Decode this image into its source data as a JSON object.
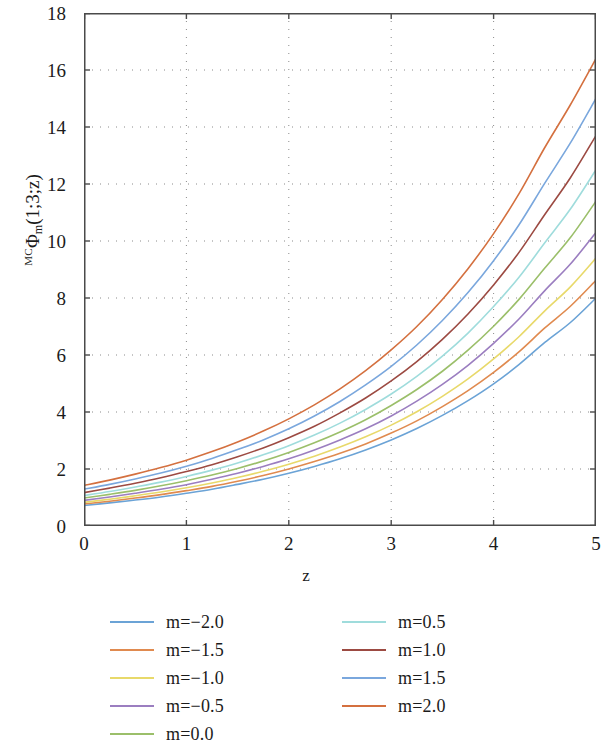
{
  "chart_data": {
    "type": "line",
    "title": "",
    "xlabel": "z",
    "ylabel_plain": "MCPhi_m(1;3;z)",
    "ylabel_parts": {
      "presuperscript": "MC",
      "symbol": "Φ",
      "subscript": "m",
      "args": "(1;3;z)"
    },
    "xlim": [
      0,
      5
    ],
    "ylim": [
      0,
      18
    ],
    "xticks": [
      "0",
      "1",
      "2",
      "3",
      "4",
      "5"
    ],
    "yticks": [
      "0",
      "2",
      "4",
      "6",
      "8",
      "10",
      "12",
      "14",
      "16",
      "18"
    ],
    "xtick_values": [
      0,
      1,
      2,
      3,
      4,
      5
    ],
    "ytick_values": [
      0,
      2,
      4,
      6,
      8,
      10,
      12,
      14,
      16,
      18
    ],
    "grid": true,
    "grid_style": "dotted",
    "legend_position": "below-plot",
    "legend_columns": 2,
    "x": [
      0,
      0.25,
      0.5,
      0.75,
      1,
      1.25,
      1.5,
      1.75,
      2,
      2.25,
      2.5,
      2.75,
      3,
      3.25,
      3.5,
      3.75,
      4,
      4.25,
      4.5,
      4.75,
      5
    ],
    "series": [
      {
        "name": "m=-2.0",
        "m": -2.0,
        "color": "#6ba3d6",
        "values": [
          0.72,
          0.81,
          0.91,
          1.02,
          1.15,
          1.29,
          1.46,
          1.64,
          1.85,
          2.09,
          2.36,
          2.67,
          3.02,
          3.42,
          3.88,
          4.4,
          4.99,
          5.67,
          6.44,
          7.14,
          8.0
        ]
      },
      {
        "name": "m=-1.5",
        "m": -1.5,
        "color": "#e08a4f",
        "values": [
          0.77,
          0.87,
          0.98,
          1.1,
          1.24,
          1.39,
          1.57,
          1.77,
          2.0,
          2.26,
          2.55,
          2.88,
          3.26,
          3.69,
          4.19,
          4.75,
          5.39,
          6.12,
          6.95,
          7.71,
          8.62
        ]
      },
      {
        "name": "m=-1.0",
        "m": -1.0,
        "color": "#e8d96a",
        "values": [
          0.83,
          0.94,
          1.06,
          1.19,
          1.34,
          1.51,
          1.7,
          1.92,
          2.17,
          2.45,
          2.77,
          3.13,
          3.54,
          4.01,
          4.55,
          5.16,
          5.86,
          6.65,
          7.55,
          8.39,
          9.4
        ]
      },
      {
        "name": "m=-0.5",
        "m": -0.5,
        "color": "#9b7ec0",
        "values": [
          0.9,
          1.02,
          1.15,
          1.29,
          1.45,
          1.64,
          1.85,
          2.09,
          2.36,
          2.67,
          3.02,
          3.41,
          3.86,
          4.38,
          4.97,
          5.64,
          6.41,
          7.27,
          8.26,
          9.19,
          10.3
        ]
      },
      {
        "name": "m=0.0",
        "m": 0.0,
        "color": "#9bbf6a",
        "values": [
          0.98,
          1.11,
          1.25,
          1.41,
          1.59,
          1.79,
          2.02,
          2.28,
          2.58,
          2.92,
          3.3,
          3.73,
          4.23,
          4.79,
          5.43,
          6.17,
          7.01,
          7.96,
          9.05,
          10.12,
          11.4
        ]
      },
      {
        "name": "m=0.5",
        "m": 0.5,
        "color": "#9fdcdc",
        "values": [
          1.07,
          1.21,
          1.37,
          1.54,
          1.74,
          1.96,
          2.21,
          2.5,
          2.82,
          3.19,
          3.61,
          4.09,
          4.63,
          5.25,
          5.96,
          6.77,
          7.7,
          8.74,
          9.94,
          11.12,
          12.5
        ]
      },
      {
        "name": "m=1.0",
        "m": 1.0,
        "color": "#9c4a42",
        "values": [
          1.17,
          1.33,
          1.5,
          1.69,
          1.91,
          2.15,
          2.43,
          2.74,
          3.1,
          3.5,
          3.97,
          4.49,
          5.09,
          5.77,
          6.55,
          7.44,
          8.46,
          9.61,
          10.93,
          12.22,
          13.7
        ]
      },
      {
        "name": "m=1.5",
        "m": 1.5,
        "color": "#7aa7dd",
        "values": [
          1.29,
          1.46,
          1.65,
          1.86,
          2.1,
          2.37,
          2.68,
          3.02,
          3.41,
          3.86,
          4.37,
          4.95,
          5.6,
          6.35,
          7.21,
          8.19,
          9.31,
          10.58,
          12.03,
          13.44,
          15.0
        ]
      },
      {
        "name": "m=2.0",
        "m": 2.0,
        "color": "#d4703f",
        "values": [
          1.42,
          1.61,
          1.82,
          2.05,
          2.31,
          2.61,
          2.95,
          3.33,
          3.76,
          4.25,
          4.81,
          5.45,
          6.18,
          7.0,
          7.95,
          9.03,
          10.26,
          11.67,
          13.28,
          14.78,
          16.4
        ]
      }
    ]
  },
  "axis": {
    "x_title": "z",
    "y_title_presup": "MC",
    "y_title_symbol": "Φ",
    "y_title_sub": "m",
    "y_title_args": "(1;3;z)"
  },
  "legend": {
    "entries": [
      {
        "label": "m=−2.0",
        "color": "#6ba3d6"
      },
      {
        "label": "m=−1.5",
        "color": "#e08a4f"
      },
      {
        "label": "m=−1.0",
        "color": "#e8d96a"
      },
      {
        "label": "m=−0.5",
        "color": "#9b7ec0"
      },
      {
        "label": "m=0.0",
        "color": "#9bbf6a"
      },
      {
        "label": "m=0.5",
        "color": "#9fdcdc"
      },
      {
        "label": "m=1.0",
        "color": "#9c4a42"
      },
      {
        "label": "m=1.5",
        "color": "#7aa7dd"
      },
      {
        "label": "m=2.0",
        "color": "#d4703f"
      }
    ]
  },
  "style": {
    "axis_color": "#4a4a4a",
    "grid_color": "#8a8a8a",
    "background": "#ffffff",
    "text_color": "#1b1b1b"
  }
}
